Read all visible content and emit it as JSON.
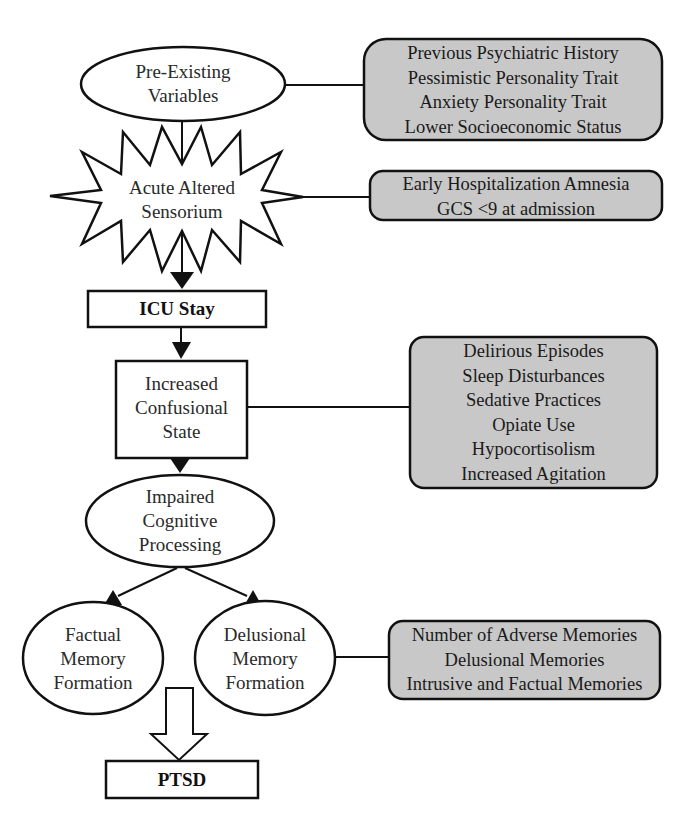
{
  "diagram": {
    "colors": {
      "stroke": "#111111",
      "factor_box_fill": "#c8c8c8",
      "node_fill": "#ffffff",
      "text": "#2a2a2a"
    },
    "nodes": {
      "pre_existing": {
        "shape": "ellipse",
        "lines": [
          "Pre-Existing",
          "Variables"
        ]
      },
      "acute_altered": {
        "shape": "starburst",
        "lines": [
          "Acute Altered",
          "Sensorium"
        ]
      },
      "icu_stay": {
        "shape": "rectangle",
        "lines": [
          "ICU Stay"
        ],
        "bold": true
      },
      "confusional": {
        "shape": "rectangle",
        "lines": [
          "Increased",
          "Confusional",
          "State"
        ]
      },
      "impaired": {
        "shape": "ellipse",
        "lines": [
          "Impaired",
          "Cognitive",
          "Processing"
        ]
      },
      "factual": {
        "shape": "ellipse",
        "lines": [
          "Factual",
          "Memory",
          "Formation"
        ]
      },
      "delusional": {
        "shape": "ellipse",
        "lines": [
          "Delusional",
          "Memory",
          "Formation"
        ]
      },
      "ptsd": {
        "shape": "rectangle",
        "lines": [
          "PTSD"
        ],
        "bold": true
      }
    },
    "factor_boxes": [
      {
        "attached_to": "pre_existing",
        "items": [
          "Previous Psychiatric History",
          "Pessimistic Personality Trait",
          "Anxiety Personality Trait",
          "Lower Socioeconomic Status"
        ]
      },
      {
        "attached_to": "acute_altered",
        "items": [
          "Early Hospitalization Amnesia",
          "GCS <9 at admission"
        ]
      },
      {
        "attached_to": "confusional",
        "items": [
          "Delirious Episodes",
          "Sleep Disturbances",
          "Sedative Practices",
          "Opiate Use",
          "Hypocortisolism",
          "Increased Agitation"
        ]
      },
      {
        "attached_to": "delusional",
        "items": [
          "Number of Adverse Memories",
          "Delusional Memories",
          "Intrusive and Factual Memories"
        ]
      }
    ],
    "edges": [
      {
        "from": "pre_existing",
        "to": "acute_altered",
        "type": "line"
      },
      {
        "from": "acute_altered",
        "to": "icu_stay",
        "type": "arrow"
      },
      {
        "from": "icu_stay",
        "to": "confusional",
        "type": "arrow"
      },
      {
        "from": "confusional",
        "to": "impaired",
        "type": "arrow"
      },
      {
        "from": "impaired",
        "to": "factual",
        "type": "arrow"
      },
      {
        "from": "impaired",
        "to": "delusional",
        "type": "arrow"
      },
      {
        "from": "factual+delusional",
        "to": "ptsd",
        "type": "hollow-arrow"
      }
    ]
  }
}
